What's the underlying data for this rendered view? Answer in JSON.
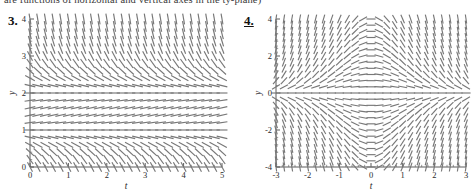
{
  "caption": {
    "text": "are functions of horizontal and vertical axes in the ty-plane)"
  },
  "figures": [
    {
      "number": "3.",
      "xlabel": "t",
      "ylabel": "y",
      "xticks": [
        "0",
        "1",
        "2",
        "3",
        "4",
        "5"
      ],
      "yticks": [
        "0",
        "1",
        "2",
        "3",
        "4"
      ],
      "chart_data": {
        "type": "quiver",
        "title": "",
        "xlabel": "t",
        "ylabel": "y",
        "xlim": [
          0,
          5
        ],
        "ylim": [
          0,
          4
        ],
        "xticks": [
          0,
          1,
          2,
          3,
          4,
          5
        ],
        "yticks": [
          0,
          1,
          2,
          3,
          4
        ],
        "grid": false,
        "legend": false,
        "minor_ticks_per_interval": 5,
        "field_description": "Direction (slope) field of an autonomous first-order ODE dy/dt = f(y). Horizontal equilibrium dashes occur near y = 2 and near y = 1. Above y = 2 the slopes are steeply negative. Between y = 1 and y = 2 the slopes are shallow/near zero. Below y = 1 the slopes turn negative again and steepen toward y = 0.",
        "slope_formula": "dy/dt = -(y-2)*(y-1)",
        "sample_slopes": [
          {
            "y": 4.0,
            "slope": -6.0
          },
          {
            "y": 3.5,
            "slope": -3.75
          },
          {
            "y": 3.0,
            "slope": -2.0
          },
          {
            "y": 2.5,
            "slope": -0.75
          },
          {
            "y": 2.0,
            "slope": 0.0
          },
          {
            "y": 1.5,
            "slope": 0.25
          },
          {
            "y": 1.0,
            "slope": 0.0
          },
          {
            "y": 0.5,
            "slope": -0.75
          },
          {
            "y": 0.0,
            "slope": -2.0
          }
        ],
        "grid_cols": 26,
        "grid_rows": 21
      }
    },
    {
      "number": "4.",
      "xlabel": "t",
      "ylabel": "y",
      "xticks": [
        "-3",
        "-2",
        "-1",
        "0",
        "1",
        "2",
        "3"
      ],
      "yticks": [
        "-4",
        "-2",
        "0",
        "2",
        "4"
      ],
      "chart_data": {
        "type": "quiver",
        "title": "",
        "xlabel": "t",
        "ylabel": "y",
        "xlim": [
          -3,
          3
        ],
        "ylim": [
          -4,
          4
        ],
        "xticks": [
          -3,
          -2,
          -1,
          0,
          1,
          2,
          3
        ],
        "yticks": [
          -4,
          -2,
          0,
          2,
          4
        ],
        "grid": false,
        "legend": false,
        "minor_ticks_per_interval": 5,
        "field_description": "Direction (slope) field of a non-autonomous first-order ODE dy/dt = f(t,y). A horizontal equilibrium line lies along y = 0. The field is symmetric under (t,y) -> (-t,-y). For y > 0 slopes are steeply positive at left, flatten to horizontal near t = 0 and become shallow to the right; for y < 0 the pattern is mirrored.",
        "slope_formula": "dy/dt = -t*y",
        "sample_slopes": [
          {
            "t": -3,
            "y": 3,
            "slope": 9
          },
          {
            "t": -2,
            "y": 2,
            "slope": 4
          },
          {
            "t": -1,
            "y": 1,
            "slope": 1
          },
          {
            "t": 0,
            "y": 2,
            "slope": 0
          },
          {
            "t": 1,
            "y": 1,
            "slope": -1
          },
          {
            "t": 2,
            "y": 2,
            "slope": -4
          },
          {
            "t": 3,
            "y": 3,
            "slope": -9
          },
          {
            "t": 0,
            "y": 0,
            "slope": 0
          },
          {
            "t": -3,
            "y": -3,
            "slope": -9
          },
          {
            "t": 3,
            "y": -3,
            "slope": 9
          }
        ],
        "grid_cols": 25,
        "grid_rows": 25
      }
    }
  ]
}
